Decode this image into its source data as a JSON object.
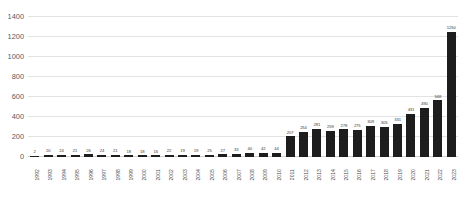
{
  "chart_data": {
    "type": "bar",
    "title": "",
    "xlabel": "",
    "ylabel": "",
    "ylim": [
      0,
      1400
    ],
    "yticks": [
      0,
      200,
      400,
      600,
      800,
      1000,
      1200,
      1400
    ],
    "grid": true,
    "legend": false,
    "bar_color": "#1d1d1d",
    "gridline_color": "#e2e2e2",
    "background_color": "#ffffff",
    "categories": [
      "1992",
      "1993",
      "1994",
      "1995",
      "1996",
      "1997",
      "1998",
      "1999",
      "2000",
      "2001",
      "2002",
      "2003",
      "2004",
      "2005",
      "2006",
      "2007",
      "2008",
      "2009",
      "2010",
      "2011",
      "2012",
      "2013",
      "2014",
      "2015",
      "2016",
      "2017",
      "2018",
      "2019",
      "2020",
      "2021",
      "2022",
      "2023"
    ],
    "values": [
      2,
      20,
      24,
      21,
      26,
      24,
      21,
      18,
      18,
      16,
      22,
      19,
      19,
      25,
      27,
      33,
      40,
      42,
      44,
      207,
      254,
      281,
      259,
      278,
      275,
      309,
      305,
      331,
      431,
      490,
      568,
      1250
    ],
    "value_labels": [
      "2",
      "20",
      "24",
      "21",
      "26",
      "24",
      "21",
      "18",
      "18",
      "16",
      "22",
      "19",
      "19",
      "25",
      "27",
      "33",
      "40",
      "42",
      "44",
      "207",
      "254",
      "281",
      "259",
      "278",
      "275",
      "309",
      "305",
      "331",
      "431",
      "490",
      "568",
      "1250"
    ]
  }
}
